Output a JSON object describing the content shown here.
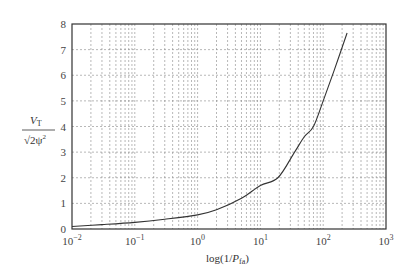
{
  "chart_data": {
    "type": "line",
    "title": "",
    "xlabel": "log(1/P_fa)",
    "xlabel_main": "log(1/",
    "xlabel_var": "P",
    "xlabel_sub": "fa",
    "xlabel_close": ")",
    "ylabel": "V_T / sqrt(2 psi^2)",
    "ylabel_num": "V",
    "ylabel_num_sub": "T",
    "ylabel_den": "√2ψ",
    "ylabel_den_sup": "2",
    "xscale": "log",
    "xlim": [
      0.01,
      1000
    ],
    "ylim": [
      0,
      8
    ],
    "grid": true,
    "x_ticks": [
      {
        "base": "10",
        "exp": "−2",
        "value": 0.01
      },
      {
        "base": "10",
        "exp": "−1",
        "value": 0.1
      },
      {
        "base": "10",
        "exp": "0",
        "value": 1
      },
      {
        "base": "10",
        "exp": "1",
        "value": 10
      },
      {
        "base": "10",
        "exp": "2",
        "value": 100
      },
      {
        "base": "10",
        "exp": "3",
        "value": 1000
      }
    ],
    "y_ticks": [
      "0",
      "1",
      "2",
      "3",
      "4",
      "5",
      "6",
      "7",
      "8"
    ],
    "series": [
      {
        "name": "threshold",
        "x": [
          0.01,
          0.03,
          0.1,
          0.3,
          1,
          2,
          5,
          10,
          19,
          35,
          50,
          70,
          100,
          150,
          240
        ],
        "y": [
          0.1,
          0.17,
          0.26,
          0.38,
          0.55,
          0.75,
          1.2,
          1.7,
          2.0,
          3.0,
          3.6,
          4.0,
          5.0,
          6.2,
          7.65
        ]
      }
    ]
  }
}
